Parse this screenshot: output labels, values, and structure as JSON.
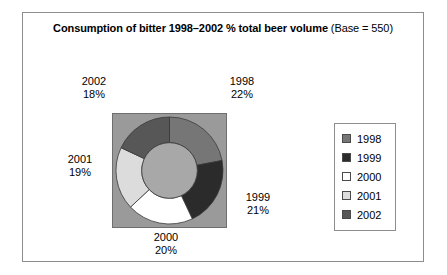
{
  "chart_data": {
    "type": "pie",
    "title_bold": "Consumption of bitter 1998–2002 % total beer volume",
    "title_normal": " (Base = 550)",
    "title_full": "Consumption of bitter 1998–2002 % total beer volume (Base = 550)",
    "base": 550,
    "categories": [
      "1998",
      "1999",
      "2000",
      "2001",
      "2002"
    ],
    "values": [
      22,
      21,
      20,
      19,
      18
    ],
    "value_labels": [
      "22%",
      "21%",
      "20%",
      "19%",
      "18%"
    ],
    "colors": [
      "#767676",
      "#2b2b2b",
      "#ffffff",
      "#dcdcdc",
      "#575757"
    ],
    "donut": true,
    "inner_radius_ratio": 0.52,
    "start_angle_deg": 0,
    "direction": "clockwise",
    "plot_background": "#9a9a9a",
    "hole_color": "#a8a8a8",
    "segment_border": "#3a3a3a",
    "xlabel": "",
    "ylabel": "",
    "legend_position": "right",
    "grid": false
  },
  "labels": [
    {
      "id": "1998",
      "year": "1998",
      "percent": "22%"
    },
    {
      "id": "1999",
      "year": "1999",
      "percent": "21%"
    },
    {
      "id": "2000",
      "year": "2000",
      "percent": "20%"
    },
    {
      "id": "2001",
      "year": "2001",
      "percent": "19%"
    },
    {
      "id": "2002",
      "year": "2002",
      "percent": "18%"
    }
  ],
  "legend": {
    "items": [
      {
        "label": "1998",
        "color": "#767676"
      },
      {
        "label": "1999",
        "color": "#2b2b2b"
      },
      {
        "label": "2000",
        "color": "#ffffff"
      },
      {
        "label": "2001",
        "color": "#dcdcdc"
      },
      {
        "label": "2002",
        "color": "#575757"
      }
    ]
  }
}
